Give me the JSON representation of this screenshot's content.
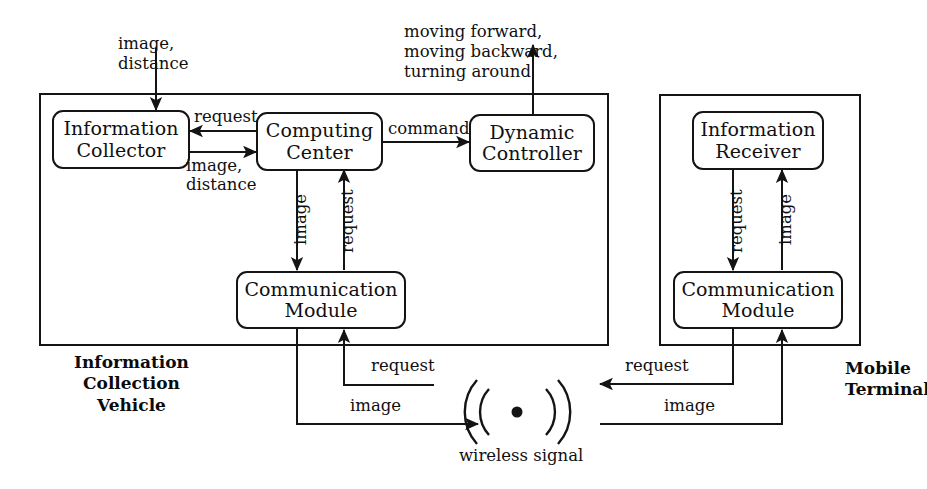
{
  "diagram": {
    "groups": [
      {
        "id": "vehicle",
        "label_lines": [
          "Information",
          "Collection",
          "Vehicle"
        ]
      },
      {
        "id": "terminal",
        "label_lines": [
          "Mobile",
          "Terminal"
        ]
      }
    ],
    "nodes": [
      {
        "id": "information-collector",
        "lines": [
          "Information",
          "Collector"
        ]
      },
      {
        "id": "computing-center",
        "lines": [
          "Computing",
          "Center"
        ]
      },
      {
        "id": "dynamic-controller",
        "lines": [
          "Dynamic",
          "Controller"
        ]
      },
      {
        "id": "vehicle-communication-module",
        "lines": [
          "Communication",
          "Module"
        ]
      },
      {
        "id": "information-receiver",
        "lines": [
          "Information",
          "Receiver"
        ]
      },
      {
        "id": "terminal-communication-module",
        "lines": [
          "Communication",
          "Module"
        ]
      }
    ],
    "io": {
      "sensor_input_lines": [
        "image,",
        "distance"
      ],
      "actuator_output_lines": [
        "moving forward,",
        "moving backward,",
        "turning around"
      ]
    },
    "edge_labels": {
      "cc_to_ic_request": "request",
      "ic_to_cc_image_distance_line1": "image,",
      "ic_to_cc_image_distance_line2": "distance",
      "cc_to_dc_command": "command",
      "cc_to_cm_image": "image",
      "cm_to_cc_request": "request",
      "ir_to_cm_request": "request",
      "cm_to_ir_image": "image",
      "vehicle_up_request": "request",
      "vehicle_out_image": "image",
      "terminal_out_request": "request",
      "terminal_in_image": "image"
    },
    "wireless": {
      "caption": "wireless signal",
      "icon": "wireless-signal-icon"
    },
    "colors": {
      "stroke": "#141414",
      "text": "#101010",
      "background": "#ffffff"
    }
  }
}
